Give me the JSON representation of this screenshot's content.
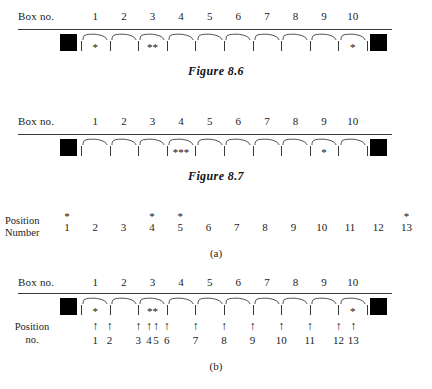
{
  "figures": [
    {
      "id": "figure-8-6",
      "row_label": "Box no.",
      "box_numbers": [
        "1",
        "2",
        "3",
        "4",
        "5",
        "6",
        "7",
        "8",
        "9",
        "10"
      ],
      "box_contents": [
        "*",
        "",
        "**",
        "",
        "",
        "",
        "",
        "",
        "",
        "*"
      ],
      "caption": "Figure 8.6",
      "has_left_endbox": true,
      "has_right_endbox": true
    },
    {
      "id": "figure-8-7",
      "row_label": "Box no.",
      "box_numbers": [
        "1",
        "2",
        "3",
        "4",
        "5",
        "6",
        "7",
        "8",
        "9",
        "10"
      ],
      "box_contents": [
        "",
        "",
        "",
        "***",
        "",
        "",
        "",
        "",
        "*",
        ""
      ],
      "caption": "Figure 8.7",
      "has_left_endbox": true,
      "has_right_endbox": true
    }
  ],
  "part_a": {
    "label_line1": "Position",
    "label_line2": "Number",
    "numbers": [
      "1",
      "2",
      "3",
      "4",
      "5",
      "6",
      "7",
      "8",
      "9",
      "10",
      "11",
      "12",
      "13"
    ],
    "starred_positions": [
      1,
      4,
      5,
      13
    ],
    "star_glyph": "*",
    "caption": "(a)"
  },
  "part_b": {
    "row_label": "Box no.",
    "box_numbers": [
      "1",
      "2",
      "3",
      "4",
      "5",
      "6",
      "7",
      "8",
      "9",
      "10"
    ],
    "box_contents": [
      "*",
      "",
      "**",
      "",
      "",
      "",
      "",
      "",
      "",
      "*"
    ],
    "position_label_line1": "Position",
    "position_label_line2": "no.",
    "position_numbers": [
      "1",
      "2",
      "3",
      "4",
      "5",
      "6",
      "7",
      "8",
      "9",
      "10",
      "11",
      "12",
      "13"
    ],
    "arrow_glyph": "↑",
    "caption": "(b)"
  },
  "colors": {
    "ink": "#1a1a1a",
    "rule": "#3a3a3a",
    "endbox": "#000000",
    "page": "#ffffff"
  }
}
